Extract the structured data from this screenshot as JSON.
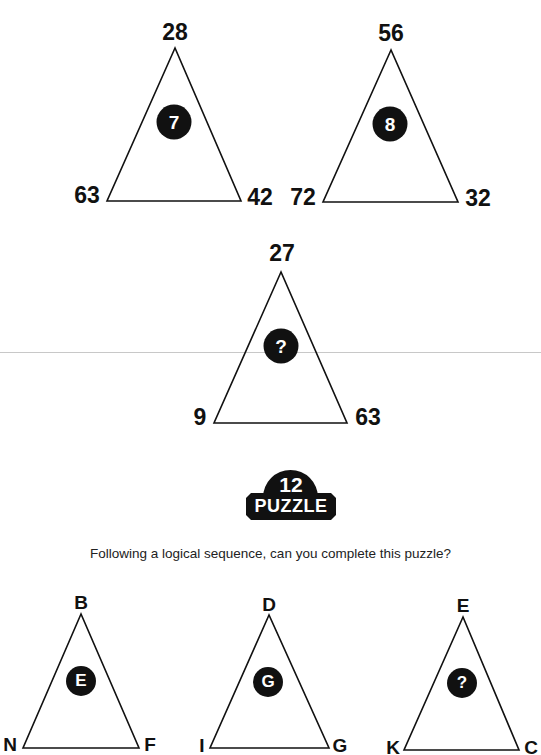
{
  "number_puzzle": {
    "triangles": [
      {
        "top": "28",
        "left": "63",
        "right": "42",
        "center": "7"
      },
      {
        "top": "56",
        "left": "72",
        "right": "32",
        "center": "8"
      },
      {
        "top": "27",
        "left": "9",
        "right": "63",
        "center": "?"
      }
    ]
  },
  "badge": {
    "number": "12",
    "word": "PUZZLE"
  },
  "instruction": "Following a logical sequence, can you complete this puzzle?",
  "letter_puzzle": {
    "triangles": [
      {
        "top": "B",
        "left": "N",
        "right": "F",
        "center": "E"
      },
      {
        "top": "D",
        "left": "I",
        "right": "G",
        "center": "G"
      },
      {
        "top": "E",
        "left": "K",
        "right": "C",
        "center": "?"
      }
    ]
  }
}
